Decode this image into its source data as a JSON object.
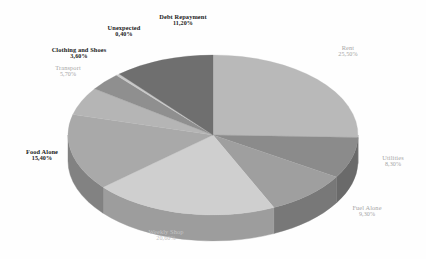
{
  "chart_data": {
    "type": "pie",
    "title": "",
    "subtitle": "",
    "xlabel": "",
    "ylabel": "",
    "legend_position": "none",
    "grid": false,
    "three_d": true,
    "value_suffix": "%",
    "decimal_separator": ",",
    "background_color": "#ffffff",
    "total": "100,00%",
    "categories": [
      "Rent",
      "Utilities",
      "Fuel Alone",
      "Weekly Shop",
      "Food Alone",
      "Transport",
      "Clothing and Shoes",
      "Unexpected",
      "Debt Repayment"
    ],
    "values": [
      25.5,
      8.3,
      9.3,
      20.6,
      15.4,
      5.7,
      3.6,
      0.4,
      11.2
    ],
    "slices": [
      {
        "name": "Rent",
        "value": 25.5,
        "label": "Rent",
        "value_text": "25,50%",
        "top_color": "#b9b9b9",
        "side_color": "#8e8e8e",
        "label_style": "light"
      },
      {
        "name": "Utilities",
        "value": 8.3,
        "label": "Utilities",
        "value_text": "8,30%",
        "top_color": "#8b8b8b",
        "side_color": "#6a6a6a",
        "label_style": "light"
      },
      {
        "name": "Fuel Alone",
        "value": 9.3,
        "label": "Fuel Alone",
        "value_text": "9,30%",
        "top_color": "#9f9f9f",
        "side_color": "#787878",
        "label_style": "light"
      },
      {
        "name": "Weekly Shop",
        "value": 20.6,
        "label": "Weekly Shop",
        "value_text": "20,60%",
        "top_color": "#cfcfcf",
        "side_color": "#9d9d9d",
        "label_style": "faint"
      },
      {
        "name": "Food Alone",
        "value": 15.4,
        "label": "Food Alone",
        "value_text": "15,40%",
        "top_color": "#a9a9a9",
        "side_color": "#828282",
        "label_style": "dark"
      },
      {
        "name": "Transport",
        "value": 5.7,
        "label": "Transport",
        "value_text": "5,70%",
        "top_color": "#b5b5b5",
        "side_color": "#8a8a8a",
        "label_style": "light"
      },
      {
        "name": "Clothing and Shoes",
        "value": 3.6,
        "label": "Clothing and Shoes",
        "value_text": "3,60%",
        "top_color": "#8f8f8f",
        "side_color": "#6e6e6e",
        "label_style": "dark"
      },
      {
        "name": "Unexpected",
        "value": 0.4,
        "label": "Unexpected",
        "value_text": "0,40%",
        "top_color": "#c8c8c8",
        "side_color": "#979797",
        "label_style": "dark"
      },
      {
        "name": "Debt Repayment",
        "value": 11.2,
        "label": "Debt Repayment",
        "value_text": "11,20%",
        "top_color": "#6f6f6f",
        "side_color": "#565656",
        "label_style": "dark"
      }
    ]
  }
}
